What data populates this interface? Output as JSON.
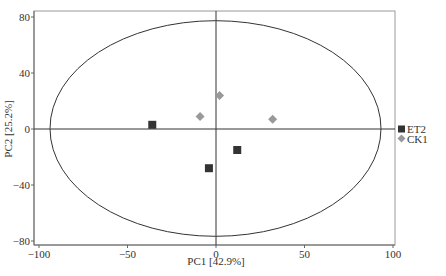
{
  "chart_data": {
    "type": "scatter",
    "title": "",
    "xlabel": "PC1 [42.9%]",
    "ylabel": "PC2 [25.2%]",
    "xlim": [
      -102,
      102
    ],
    "ylim": [
      -83,
      84
    ],
    "xticks": [
      -100,
      -50,
      0,
      50,
      100
    ],
    "yticks": [
      -80,
      -40,
      0,
      40,
      80
    ],
    "grid": false,
    "legend_position": "right",
    "reference_lines": {
      "x": 0,
      "y": 0
    },
    "ellipse": {
      "cx": 0,
      "cy": 0,
      "rx": 93.5,
      "ry": 77
    },
    "series": [
      {
        "name": "ET2",
        "marker": "square",
        "color": "#333333",
        "points": [
          {
            "x": -36,
            "y": 3
          },
          {
            "x": -4,
            "y": -28
          },
          {
            "x": 12,
            "y": -15
          }
        ]
      },
      {
        "name": "CK1",
        "marker": "diamond",
        "color": "#999999",
        "points": [
          {
            "x": -9,
            "y": 9
          },
          {
            "x": 2,
            "y": 24
          },
          {
            "x": 32,
            "y": 7
          }
        ]
      }
    ]
  }
}
